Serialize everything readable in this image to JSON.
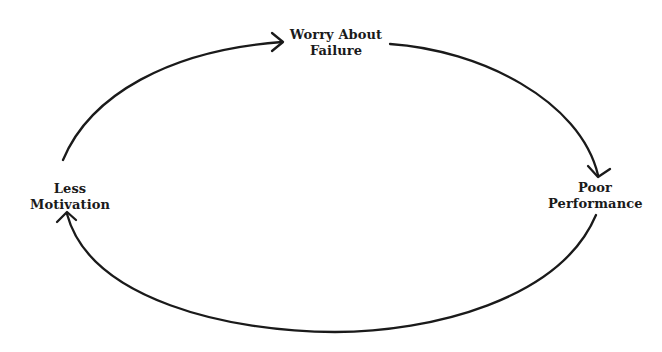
{
  "diagram": {
    "type": "cycle",
    "nodes": [
      {
        "id": "worry",
        "lines": [
          "Worry About",
          "Failure"
        ]
      },
      {
        "id": "poor",
        "lines": [
          "Poor",
          "Performance"
        ]
      },
      {
        "id": "less",
        "lines": [
          "Less",
          "Motivation"
        ]
      }
    ],
    "edges": [
      {
        "from": "worry",
        "to": "poor"
      },
      {
        "from": "poor",
        "to": "less"
      },
      {
        "from": "less",
        "to": "worry"
      }
    ],
    "colors": {
      "stroke": "#1a1a1a",
      "text": "#1a1a1a",
      "background": "#ffffff"
    }
  }
}
